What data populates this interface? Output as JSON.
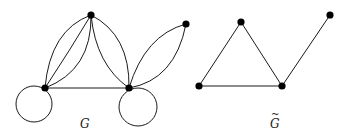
{
  "graphs": [
    {
      "id": "G",
      "label": "G",
      "nodes": [
        {
          "id": "top",
          "x": 91,
          "y": 15
        },
        {
          "id": "left",
          "x": 45,
          "y": 88
        },
        {
          "id": "right",
          "x": 129,
          "y": 88
        },
        {
          "id": "far",
          "x": 186,
          "y": 24
        }
      ],
      "edges": [
        {
          "from": "top",
          "to": "left",
          "multiplicity": 3
        },
        {
          "from": "top",
          "to": "right",
          "multiplicity": 2
        },
        {
          "from": "left",
          "to": "right",
          "multiplicity": 1
        },
        {
          "from": "right",
          "to": "far",
          "multiplicity": 2
        },
        {
          "from": "left",
          "to": "left",
          "type": "loop"
        },
        {
          "from": "right",
          "to": "right",
          "type": "loop"
        }
      ]
    },
    {
      "id": "G_tilde",
      "label": "G",
      "label_accent": "~",
      "nodes": [
        {
          "id": "top",
          "x": 241,
          "y": 22
        },
        {
          "id": "left",
          "x": 199,
          "y": 86
        },
        {
          "id": "right",
          "x": 282,
          "y": 86
        },
        {
          "id": "far",
          "x": 330,
          "y": 15
        }
      ],
      "edges": [
        {
          "from": "top",
          "to": "left"
        },
        {
          "from": "top",
          "to": "right"
        },
        {
          "from": "left",
          "to": "right"
        },
        {
          "from": "right",
          "to": "far"
        }
      ]
    }
  ],
  "colors": {
    "edge": "#1a1a1a",
    "node": "#000000",
    "background": "#ffffff"
  }
}
